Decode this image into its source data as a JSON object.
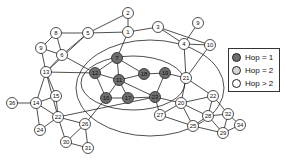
{
  "diagram": {
    "type": "network-graph",
    "colors": {
      "hop1": "#6e6e6e",
      "hop2": "#d6d6d6",
      "hop_gt2": "#ffffff"
    },
    "legend": [
      {
        "label": "Hop = 1",
        "category": "hop1"
      },
      {
        "label": "Hop = 2",
        "category": "hop2"
      },
      {
        "label": "Hop > 2",
        "category": "hop_gt2"
      }
    ],
    "nodes": [
      {
        "id": "n2",
        "label": "2",
        "category": "hop_gt2"
      },
      {
        "id": "n1",
        "label": "1",
        "category": "hop_gt2"
      },
      {
        "id": "n3",
        "label": "3",
        "category": "hop_gt2"
      },
      {
        "id": "n9r",
        "label": "9",
        "category": "hop_gt2"
      },
      {
        "id": "n5",
        "label": "5",
        "category": "hop_gt2"
      },
      {
        "id": "n8",
        "label": "8",
        "category": "hop_gt2"
      },
      {
        "id": "n4",
        "label": "4",
        "category": "hop_gt2"
      },
      {
        "id": "n10",
        "label": "10",
        "category": "hop_gt2"
      },
      {
        "id": "n9l",
        "label": "9",
        "category": "hop_gt2"
      },
      {
        "id": "n6",
        "label": "6",
        "category": "hop_gt2"
      },
      {
        "id": "n7",
        "label": "7",
        "category": "hop1"
      },
      {
        "id": "n13",
        "label": "13",
        "category": "hop_gt2"
      },
      {
        "id": "n12",
        "label": "12",
        "category": "hop1"
      },
      {
        "id": "n11",
        "label": "11",
        "category": "hop1"
      },
      {
        "id": "n18",
        "label": "18",
        "category": "hop1"
      },
      {
        "id": "n19",
        "label": "19",
        "category": "hop1"
      },
      {
        "id": "n21",
        "label": "21",
        "category": "hop_gt2"
      },
      {
        "id": "n16",
        "label": "16",
        "category": "hop1"
      },
      {
        "id": "n17",
        "label": "17",
        "category": "hop1"
      },
      {
        "id": "n23",
        "label": "23",
        "category": "hop1"
      },
      {
        "id": "n15",
        "label": "15",
        "category": "hop_gt2"
      },
      {
        "id": "n14",
        "label": "14",
        "category": "hop_gt2"
      },
      {
        "id": "n36",
        "label": "36",
        "category": "hop_gt2"
      },
      {
        "id": "n22l",
        "label": "22",
        "category": "hop_gt2"
      },
      {
        "id": "n26",
        "label": "26",
        "category": "hop_gt2"
      },
      {
        "id": "n24",
        "label": "24",
        "category": "hop_gt2"
      },
      {
        "id": "n30",
        "label": "30",
        "category": "hop_gt2"
      },
      {
        "id": "n31",
        "label": "31",
        "category": "hop_gt2"
      },
      {
        "id": "n27",
        "label": "27",
        "category": "hop_gt2"
      },
      {
        "id": "n20",
        "label": "20",
        "category": "hop_gt2"
      },
      {
        "id": "n22r",
        "label": "22",
        "category": "hop_gt2"
      },
      {
        "id": "n28",
        "label": "28",
        "category": "hop_gt2"
      },
      {
        "id": "n32",
        "label": "32",
        "category": "hop_gt2"
      },
      {
        "id": "n34",
        "label": "34",
        "category": "hop_gt2"
      },
      {
        "id": "n25",
        "label": "25",
        "category": "hop_gt2"
      },
      {
        "id": "n29",
        "label": "29",
        "category": "hop_gt2"
      }
    ],
    "edges": [
      [
        "n2",
        "n1"
      ],
      [
        "n2",
        "n5"
      ],
      [
        "n1",
        "n5"
      ],
      [
        "n1",
        "n3"
      ],
      [
        "n1",
        "n7"
      ],
      [
        "n5",
        "n8"
      ],
      [
        "n5",
        "n6"
      ],
      [
        "n5",
        "n13"
      ],
      [
        "n8",
        "n9l"
      ],
      [
        "n8",
        "n6"
      ],
      [
        "n9l",
        "n6"
      ],
      [
        "n9l",
        "n13"
      ],
      [
        "n6",
        "n12"
      ],
      [
        "n6",
        "n13"
      ],
      [
        "n13",
        "n12"
      ],
      [
        "n3",
        "n4"
      ],
      [
        "n3",
        "n10"
      ],
      [
        "n9r",
        "n4"
      ],
      [
        "n4",
        "n10"
      ],
      [
        "n4",
        "n21"
      ],
      [
        "n10",
        "n21"
      ],
      [
        "n7",
        "n12"
      ],
      [
        "n7",
        "n11"
      ],
      [
        "n7",
        "n18"
      ],
      [
        "n12",
        "n11"
      ],
      [
        "n12",
        "n16"
      ],
      [
        "n11",
        "n16"
      ],
      [
        "n11",
        "n17"
      ],
      [
        "n11",
        "n18"
      ],
      [
        "n11",
        "n23"
      ],
      [
        "n16",
        "n17"
      ],
      [
        "n17",
        "n23"
      ],
      [
        "n18",
        "n19"
      ],
      [
        "n19",
        "n21"
      ],
      [
        "n19",
        "n23"
      ],
      [
        "n21",
        "n22r"
      ],
      [
        "n21",
        "n20"
      ],
      [
        "n23",
        "n20"
      ],
      [
        "n23",
        "n27"
      ],
      [
        "n20",
        "n27"
      ],
      [
        "n20",
        "n22r"
      ],
      [
        "n20",
        "n28"
      ],
      [
        "n20",
        "n25"
      ],
      [
        "n27",
        "n25"
      ],
      [
        "n22r",
        "n28"
      ],
      [
        "n22r",
        "n32"
      ],
      [
        "n28",
        "n32"
      ],
      [
        "n28",
        "n29"
      ],
      [
        "n28",
        "n25"
      ],
      [
        "n32",
        "n34"
      ],
      [
        "n32",
        "n29"
      ],
      [
        "n34",
        "n29"
      ],
      [
        "n25",
        "n29"
      ],
      [
        "n13",
        "n14"
      ],
      [
        "n13",
        "n15"
      ],
      [
        "n13",
        "n22l"
      ],
      [
        "n14",
        "n36"
      ],
      [
        "n14",
        "n15"
      ],
      [
        "n14",
        "n22l"
      ],
      [
        "n14",
        "n24"
      ],
      [
        "n15",
        "n22l"
      ],
      [
        "n22l",
        "n24"
      ],
      [
        "n22l",
        "n26"
      ],
      [
        "n22l",
        "n30"
      ],
      [
        "n26",
        "n30"
      ],
      [
        "n26",
        "n31"
      ],
      [
        "n30",
        "n31"
      ],
      [
        "n26",
        "n16"
      ],
      [
        "n22l",
        "n23"
      ]
    ]
  }
}
